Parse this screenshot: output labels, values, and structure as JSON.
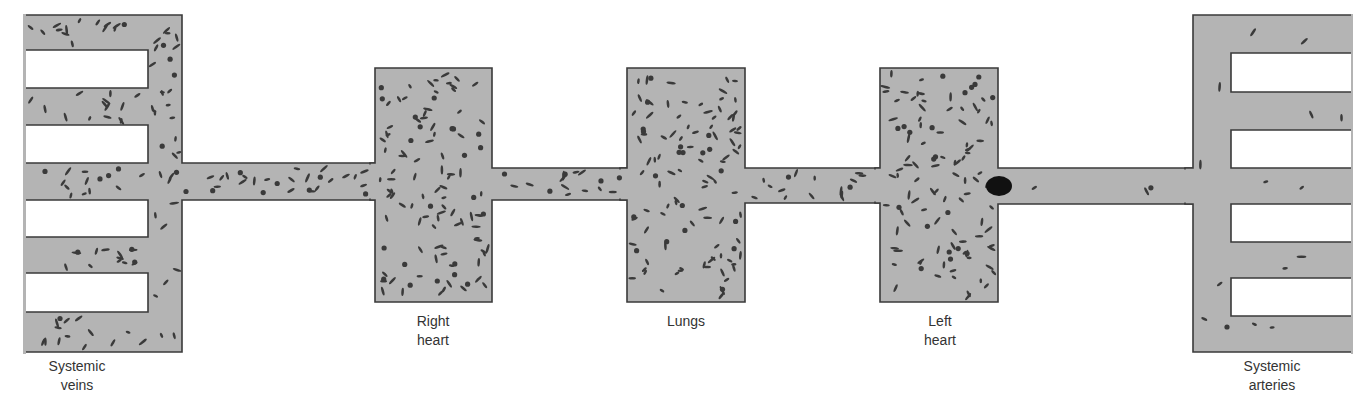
{
  "figure": {
    "type": "circulation-schematic",
    "colors": {
      "vessel_fill": "#b4b4b4",
      "vessel_outline": "#3a3a3a",
      "particle": "#3a3a3a",
      "embolus": "#111111",
      "label_text": "#333333"
    },
    "compartments": [
      {
        "id": "systemic-veins",
        "label_line1": "Systemic",
        "label_line2": "veins",
        "particle_density": "high"
      },
      {
        "id": "right-heart",
        "label_line1": "Right",
        "label_line2": "heart",
        "particle_density": "high"
      },
      {
        "id": "lungs",
        "label_line1": "Lungs",
        "label_line2": "",
        "particle_density": "high"
      },
      {
        "id": "left-heart",
        "label_line1": "Left",
        "label_line2": "heart",
        "particle_density": "high"
      },
      {
        "id": "systemic-arteries",
        "label_line1": "Systemic",
        "label_line2": "arteries",
        "particle_density": "low"
      }
    ],
    "embolus": {
      "location": "left heart outflow",
      "shape": "ellipse"
    }
  }
}
